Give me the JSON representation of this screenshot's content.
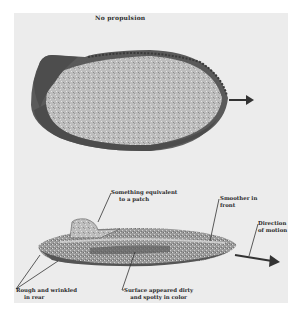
{
  "document": {
    "caption_top": "No propulsion",
    "background_color": "#ececec",
    "ink_color": "#2a2a2a"
  },
  "figures": {
    "top_view": {
      "description": "Oval craft seen from above, moving right",
      "arrow": "direction-arrow"
    },
    "side_view": {
      "description": "Elongated craft seen from side, moving right",
      "annotations": {
        "patch": [
          "Something equivalent",
          "to a patch"
        ],
        "smoother": [
          "Smoother in",
          "front"
        ],
        "direction": [
          "Direction",
          "of motion"
        ],
        "rough": [
          "Rough and wrinkled",
          "in rear"
        ],
        "surface": [
          "Surface appeared dirty",
          "and spotty in color"
        ]
      }
    }
  }
}
